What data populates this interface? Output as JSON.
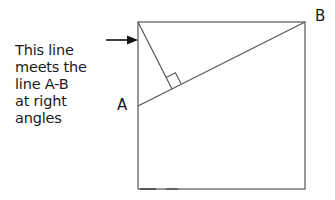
{
  "caption": {
    "lines": [
      "This line",
      "meets the",
      "line A-B",
      "at right",
      "angles"
    ]
  },
  "labels": {
    "a": "A",
    "b": "B"
  },
  "colors": {
    "stroke": "#555555",
    "arrow": "#111111",
    "text": "#1a1a1a"
  },
  "geometry": {
    "square": {
      "x": 138,
      "y": 22,
      "width": 167,
      "height": 167
    },
    "point_a": {
      "x": 138,
      "y": 106
    },
    "point_b": {
      "x": 305,
      "y": 22
    },
    "perpendicular_from": {
      "x": 138,
      "y": 22
    },
    "perpendicular_foot": {
      "x": 172,
      "y": 89
    },
    "arrow": {
      "x1": 106,
      "y1": 40,
      "x2": 138,
      "y2": 40
    }
  }
}
